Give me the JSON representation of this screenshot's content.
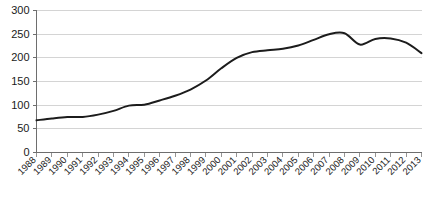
{
  "chart_data": {
    "type": "line",
    "title": "",
    "xlabel": "",
    "ylabel": "",
    "ylim": [
      0,
      300
    ],
    "ytick_step": 50,
    "yticks": [
      0,
      50,
      100,
      150,
      200,
      250,
      300
    ],
    "grid": true,
    "legend": "none",
    "line_color": "#1c1c1c",
    "gridline_color": "#d4d4d4",
    "axis_color": "#6e6e6e",
    "categories": [
      "1988",
      "1989",
      "1990",
      "1991",
      "1992",
      "1993",
      "1994",
      "1995",
      "1996",
      "1997",
      "1998",
      "1999",
      "2000",
      "2001",
      "2002",
      "2003",
      "2004",
      "2005",
      "2006",
      "2007",
      "2008",
      "2009",
      "2010",
      "2011",
      "2012",
      "2013"
    ],
    "series": [
      {
        "name": "",
        "values": [
          68,
          72,
          75,
          75,
          80,
          88,
          99,
          101,
          110,
          120,
          133,
          152,
          178,
          200,
          212,
          216,
          219,
          226,
          238,
          250,
          252,
          228,
          240,
          241,
          232,
          210
        ]
      }
    ]
  }
}
